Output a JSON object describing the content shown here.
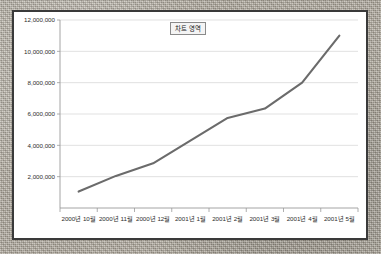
{
  "chart_data": {
    "type": "line",
    "title": "차트 영역",
    "xlabel": "",
    "ylabel": "",
    "grid": true,
    "legend": false,
    "ylim": [
      0,
      12000000
    ],
    "yticks": [
      2000000,
      4000000,
      6000000,
      8000000,
      10000000,
      12000000
    ],
    "ytick_labels": [
      "2,000,000",
      "4,000,000",
      "6,000,000",
      "8,000,000",
      "10,000,000",
      "12,000,000"
    ],
    "categories": [
      "2000년 10월",
      "2000년 11월",
      "2000년 12월",
      "2001년 1월",
      "2001년 2월",
      "2001년 3월",
      "2001년 4월",
      "2001년 5월"
    ],
    "series": [
      {
        "name": "계열1",
        "color": "#6b6b6b",
        "values": [
          1050000,
          2050000,
          2850000,
          4300000,
          5750000,
          6350000,
          8000000,
          11000000
        ]
      }
    ]
  },
  "chart": {
    "title_label": "차트 영역",
    "line_color": "#6b6b6b",
    "grid_color": "#d9d9d9",
    "axis_color": "#9a9a9a",
    "frame_color": "#3a3a3a",
    "plot_background": "#ffffff"
  }
}
